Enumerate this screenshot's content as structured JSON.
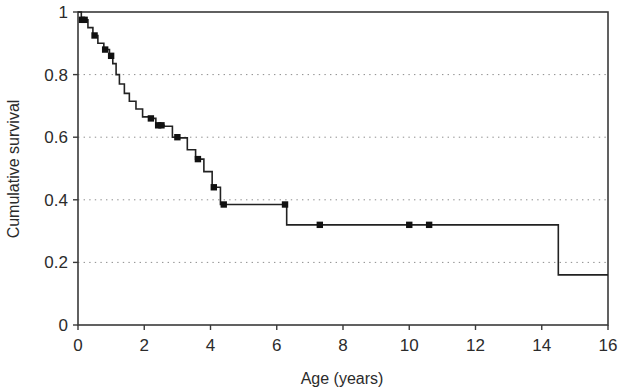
{
  "chart_data": {
    "type": "line",
    "subtype": "kaplan-meier-step",
    "title": "",
    "xlabel": "Age (years)",
    "ylabel": "Cumulative survival",
    "xlim": [
      0,
      16
    ],
    "ylim": [
      0,
      1
    ],
    "xticks": [
      0,
      2,
      4,
      6,
      8,
      10,
      12,
      14,
      16
    ],
    "xticklabels": [
      "0",
      "2",
      "4",
      "6",
      "8",
      "10",
      "12",
      "14",
      "16"
    ],
    "yticks": [
      0,
      0.2,
      0.4,
      0.6,
      0.8,
      1
    ],
    "yticklabels": [
      "0",
      "0.2",
      "0.4",
      "0.6",
      "0.8",
      "1"
    ],
    "grid": {
      "horizontal": true,
      "vertical": false,
      "style": "dotted",
      "levels": [
        0.2,
        0.4,
        0.6,
        0.8
      ],
      "color": "#8d8d8d"
    },
    "legend": null,
    "series": [
      {
        "name": "Cumulative survival",
        "color": "#222222",
        "step": "post",
        "x": [
          0.0,
          0.1,
          0.3,
          0.45,
          0.6,
          0.78,
          0.95,
          1.05,
          1.15,
          1.25,
          1.4,
          1.55,
          1.75,
          1.95,
          2.15,
          2.35,
          2.6,
          2.85,
          3.05,
          3.3,
          3.55,
          3.8,
          4.05,
          4.3,
          6.3,
          14.5,
          16.0
        ],
        "y": [
          1.0,
          0.975,
          0.95,
          0.925,
          0.9,
          0.88,
          0.86,
          0.835,
          0.8,
          0.77,
          0.74,
          0.715,
          0.69,
          0.665,
          0.66,
          0.638,
          0.635,
          0.6,
          0.598,
          0.56,
          0.53,
          0.49,
          0.44,
          0.385,
          0.32,
          0.16,
          0.16
        ]
      }
    ],
    "censored": {
      "marker": "square",
      "color": "#111111",
      "points": [
        {
          "x": 0.12,
          "y": 0.975
        },
        {
          "x": 0.2,
          "y": 0.975
        },
        {
          "x": 0.5,
          "y": 0.925
        },
        {
          "x": 0.82,
          "y": 0.88
        },
        {
          "x": 1.0,
          "y": 0.86
        },
        {
          "x": 2.2,
          "y": 0.66
        },
        {
          "x": 2.42,
          "y": 0.638
        },
        {
          "x": 2.52,
          "y": 0.638
        },
        {
          "x": 3.0,
          "y": 0.6
        },
        {
          "x": 3.62,
          "y": 0.53
        },
        {
          "x": 4.1,
          "y": 0.44
        },
        {
          "x": 4.4,
          "y": 0.385
        },
        {
          "x": 6.25,
          "y": 0.385
        },
        {
          "x": 7.3,
          "y": 0.32
        },
        {
          "x": 10.0,
          "y": 0.32
        },
        {
          "x": 10.6,
          "y": 0.32
        }
      ]
    }
  },
  "axes": {
    "frame_color": "#3a3a3a",
    "background": "#ffffff"
  }
}
